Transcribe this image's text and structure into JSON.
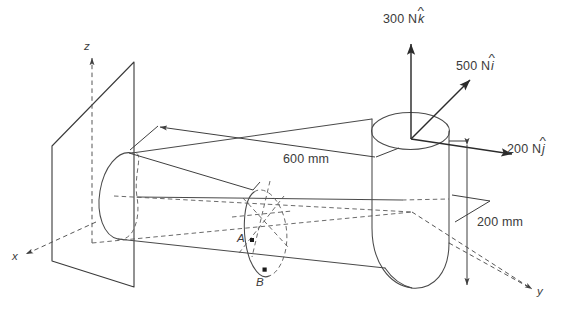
{
  "figure": {
    "background_color": "#ffffff",
    "line_color": "#3a3a3a",
    "text_color": "#3b3b3b"
  },
  "axes": [
    {
      "name": "z-axis",
      "label": "z"
    },
    {
      "name": "x-axis",
      "label": "x"
    },
    {
      "name": "y-axis",
      "label": "y"
    }
  ],
  "forces": [
    {
      "name": "force-300",
      "magnitude": "300 N",
      "direction_symbol": "k",
      "full_label": "300 N k̂",
      "direction": "vertical up"
    },
    {
      "name": "force-500",
      "magnitude": "500 N",
      "direction_symbol": "i",
      "full_label": "500 N î",
      "direction": "up and to the right"
    },
    {
      "name": "force-200",
      "magnitude": "200 N",
      "direction_symbol": "j",
      "full_label": "200 N ĵ",
      "direction": "down and to the right"
    }
  ],
  "dimensions": [
    {
      "name": "dimension-600",
      "value": "600 mm",
      "orientation": "along-pipe"
    },
    {
      "name": "dimension-200",
      "value": "200 mm",
      "orientation": "vertical"
    }
  ],
  "points": [
    {
      "name": "point-a",
      "label": "A"
    },
    {
      "name": "point-b",
      "label": "B"
    }
  ]
}
